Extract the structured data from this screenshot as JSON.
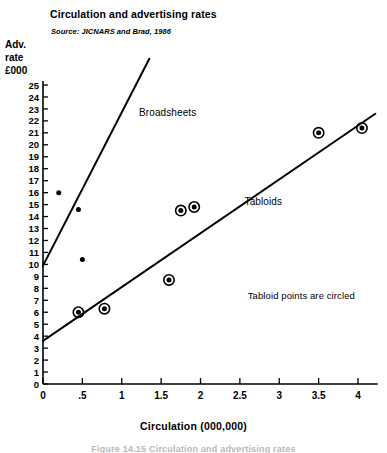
{
  "chart_data": {
    "type": "scatter",
    "title": "Circulation and advertising rates",
    "subtitle": "Source: JICNARS and Brad, 1986",
    "xlabel": "Circulation (000,000)",
    "ylabel": "Adv. rate £000",
    "ylabel_lines": [
      "Adv.",
      "rate",
      "£000"
    ],
    "xlim": [
      0,
      4.25
    ],
    "ylim": [
      0,
      25
    ],
    "xticks": [
      0,
      0.5,
      1,
      1.5,
      2,
      2.5,
      3,
      3.5,
      4
    ],
    "xtick_labels": [
      "0",
      ".5",
      "1",
      "1.5",
      "2",
      "2.5",
      "3",
      "3.5",
      "4"
    ],
    "yticks": [
      0,
      1,
      2,
      3,
      4,
      5,
      6,
      7,
      8,
      9,
      10,
      11,
      12,
      13,
      14,
      15,
      16,
      17,
      18,
      19,
      20,
      21,
      22,
      23,
      24,
      25
    ],
    "ytick_labels": [
      "0",
      "1",
      "2",
      "3",
      "4",
      "5",
      "6",
      "7",
      "8",
      "9",
      "10",
      "11",
      "12",
      "13",
      "14",
      "15",
      "16",
      "17",
      "18",
      "19",
      "20",
      "21",
      "22",
      "23",
      "24",
      "25"
    ],
    "grid": false,
    "legend_position": "inline-annotations",
    "series": [
      {
        "name": "Broadsheets",
        "marker": "filled-dot",
        "circled": false,
        "points": [
          {
            "x": 0.2,
            "y": 16.0
          },
          {
            "x": 0.45,
            "y": 14.6
          },
          {
            "x": 0.5,
            "y": 10.4
          }
        ],
        "fit_line": {
          "x0": 0.0,
          "y0": 9.9,
          "x1": 1.35,
          "y1": 27.2
        }
      },
      {
        "name": "Tabloids",
        "marker": "circled-dot",
        "circled": true,
        "points": [
          {
            "x": 0.45,
            "y": 6.0
          },
          {
            "x": 0.78,
            "y": 6.3
          },
          {
            "x": 1.6,
            "y": 8.7
          },
          {
            "x": 1.75,
            "y": 14.5
          },
          {
            "x": 1.92,
            "y": 14.8
          },
          {
            "x": 3.5,
            "y": 21.0
          },
          {
            "x": 4.05,
            "y": 21.4
          }
        ],
        "fit_line": {
          "x0": 0.0,
          "y0": 3.6,
          "x1": 4.22,
          "y1": 22.6
        }
      }
    ],
    "annotations": [
      {
        "text": "Broadsheets",
        "x": 1.22,
        "y": 22.6
      },
      {
        "text": "Tabloids",
        "x": 2.56,
        "y": 15.1
      },
      {
        "text": "Tabloid points are circled",
        "x": 2.6,
        "y": 7.3
      }
    ]
  },
  "figure": {
    "caption": "Figure 14.15   Circulation and advertising rates"
  }
}
